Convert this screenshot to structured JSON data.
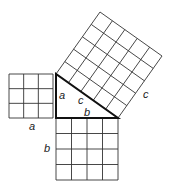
{
  "diagram": {
    "triangle": {
      "vertices": [
        [
          56,
          74
        ],
        [
          56,
          118
        ],
        [
          118,
          118
        ]
      ],
      "leg_a_units": 3,
      "leg_b_units": 4,
      "hypotenuse_c_units": 5
    },
    "squares": {
      "a": {
        "units": 3,
        "origin": [
          9,
          74
        ],
        "size": 44
      },
      "b": {
        "units": 4,
        "origin": [
          56,
          118
        ],
        "size": 62
      },
      "c": {
        "units": 5,
        "corners": [
          [
            56,
            74
          ],
          [
            118,
            118
          ],
          [
            162,
            56
          ],
          [
            100,
            12
          ]
        ]
      }
    },
    "labels": {
      "a_inside": "a",
      "a_below": "a",
      "b_inside": "b",
      "b_left": "b",
      "c_inside": "c",
      "c_outside": "c"
    },
    "colors": {
      "grid": "#333333",
      "triangle_edge": "#111111",
      "background": "#ffffff"
    }
  }
}
